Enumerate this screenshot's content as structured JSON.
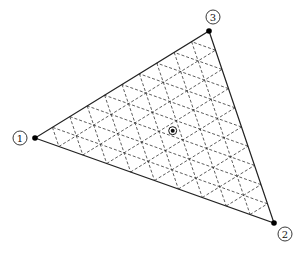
{
  "diagram": {
    "type": "triangular-element-grid",
    "subdivisions": 10,
    "vertices": [
      {
        "id": "1",
        "label": "1",
        "x": 35,
        "y": 138,
        "label_x": 20,
        "label_y": 138
      },
      {
        "id": "2",
        "label": "2",
        "x": 274,
        "y": 223,
        "label_x": 285,
        "label_y": 234
      },
      {
        "id": "3",
        "label": "3",
        "x": 209,
        "y": 31,
        "label_x": 213,
        "label_y": 17
      }
    ],
    "centroid_marker": {
      "x": 172.7,
      "y": 130.7
    },
    "colors": {
      "stroke": "#222222",
      "grid": "#333333",
      "background": "#ffffff"
    }
  }
}
